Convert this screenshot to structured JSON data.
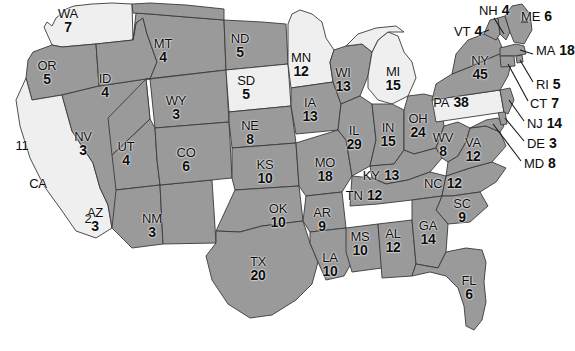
{
  "map": {
    "title": "United States Electoral College Map",
    "colors": {
      "won_fill": "#9a9a9a",
      "lost_fill": "#efefef",
      "border": "#3a3a3a",
      "background": "#ffffff",
      "label_text": "#0d0d0d"
    },
    "inline_states": [
      {
        "code": "WA",
        "ev": "7",
        "shade": "light",
        "x": 68,
        "y": 8
      },
      {
        "code": "OR",
        "ev": "5",
        "shade": "dark",
        "x": 47,
        "y": 60
      },
      {
        "code": "ID",
        "ev": "4",
        "shade": "dark",
        "x": 105,
        "y": 73
      },
      {
        "code": "MT",
        "ev": "4",
        "shade": "dark",
        "x": 163,
        "y": 38
      },
      {
        "code": "WY",
        "ev": "3",
        "shade": "dark",
        "x": 176,
        "y": 95
      },
      {
        "code": "NV",
        "ev": "3",
        "shade": "dark",
        "x": 83,
        "y": 131
      },
      {
        "code": "UT",
        "ev": "4",
        "shade": "dark",
        "x": 126,
        "y": 141
      },
      {
        "code": "AZ",
        "ev": "3",
        "shade": "dark",
        "x": 95,
        "y": 207
      },
      {
        "code": "NM",
        "ev": "3",
        "shade": "dark",
        "x": 152,
        "y": 213
      },
      {
        "code": "CO",
        "ev": "6",
        "shade": "dark",
        "x": 186,
        "y": 147
      },
      {
        "code": "ND",
        "ev": "5",
        "shade": "dark",
        "x": 240,
        "y": 33
      },
      {
        "code": "SD",
        "ev": "5",
        "shade": "light",
        "x": 246,
        "y": 75
      },
      {
        "code": "NE",
        "ev": "8",
        "shade": "dark",
        "x": 250,
        "y": 120
      },
      {
        "code": "KS",
        "ev": "10",
        "shade": "dark",
        "x": 265,
        "y": 159
      },
      {
        "code": "OK",
        "ev": "10",
        "shade": "dark",
        "x": 278,
        "y": 203
      },
      {
        "code": "TX",
        "ev": "20",
        "shade": "dark",
        "x": 258,
        "y": 256
      },
      {
        "code": "MN",
        "ev": "12",
        "shade": "light",
        "x": 301,
        "y": 52
      },
      {
        "code": "IA",
        "ev": "13",
        "shade": "dark",
        "x": 310,
        "y": 97
      },
      {
        "code": "MO",
        "ev": "18",
        "shade": "dark",
        "x": 325,
        "y": 157
      },
      {
        "code": "AR",
        "ev": "9",
        "shade": "dark",
        "x": 322,
        "y": 207
      },
      {
        "code": "LA",
        "ev": "10",
        "shade": "dark",
        "x": 330,
        "y": 252
      },
      {
        "code": "MS",
        "ev": "10",
        "shade": "dark",
        "x": 360,
        "y": 231
      },
      {
        "code": "AL",
        "ev": "12",
        "shade": "dark",
        "x": 393,
        "y": 228
      },
      {
        "code": "WI",
        "ev": "13",
        "shade": "dark",
        "x": 343,
        "y": 67
      },
      {
        "code": "MI",
        "ev": "15",
        "shade": "light",
        "x": 393,
        "y": 66
      },
      {
        "code": "IL",
        "ev": "29",
        "shade": "dark",
        "x": 354,
        "y": 125
      },
      {
        "code": "IN",
        "ev": "15",
        "shade": "dark",
        "x": 388,
        "y": 122
      },
      {
        "code": "OH",
        "ev": "24",
        "shade": "dark",
        "x": 418,
        "y": 113
      },
      {
        "code": "GA",
        "ev": "14",
        "shade": "dark",
        "x": 428,
        "y": 220
      },
      {
        "code": "SC",
        "ev": "9",
        "shade": "dark",
        "x": 462,
        "y": 198
      },
      {
        "code": "FL",
        "ev": "6",
        "shade": "dark",
        "x": 469,
        "y": 275
      },
      {
        "code": "WV",
        "ev": "8",
        "shade": "dark",
        "x": 443,
        "y": 132
      },
      {
        "code": "VA",
        "ev": "12",
        "shade": "dark",
        "x": 473,
        "y": 137
      },
      {
        "code": "NY",
        "ev": "45",
        "shade": "dark",
        "x": 480,
        "y": 55
      }
    ],
    "inline_row_states": [
      {
        "code": "KY",
        "ev": "13",
        "shade": "dark",
        "x": 381,
        "y": 167
      },
      {
        "code": "TN",
        "ev": "12",
        "shade": "dark",
        "x": 364,
        "y": 187
      },
      {
        "code": "NC",
        "ev": "12",
        "shade": "dark",
        "x": 443,
        "y": 175
      },
      {
        "code": "PA",
        "ev": "38",
        "shade": "light",
        "x": 451,
        "y": 94
      }
    ],
    "callout_states": [
      {
        "code": "NH",
        "ev": "4",
        "shade": "dark",
        "x": 479,
        "y": 2
      },
      {
        "code": "ME",
        "ev": "6",
        "shade": "dark",
        "x": 521,
        "y": 8
      },
      {
        "code": "VT",
        "ev": "4",
        "shade": "dark",
        "x": 454,
        "y": 23
      },
      {
        "code": "MA",
        "ev": "18",
        "shade": "dark",
        "x": 536,
        "y": 42
      },
      {
        "code": "RI",
        "ev": "5",
        "shade": "dark",
        "x": 536,
        "y": 76
      },
      {
        "code": "CT",
        "ev": "7",
        "shade": "dark",
        "x": 530,
        "y": 95
      },
      {
        "code": "NJ",
        "ev": "14",
        "shade": "dark",
        "x": 527,
        "y": 115
      },
      {
        "code": "DE",
        "ev": "3",
        "shade": "dark",
        "x": 527,
        "y": 135
      },
      {
        "code": "MD",
        "ev": "8",
        "shade": "dark",
        "x": 524,
        "y": 155
      }
    ],
    "ca_labels": [
      {
        "code": "11",
        "x": 22,
        "y": 140
      },
      {
        "code": "CA",
        "x": 38,
        "y": 178
      },
      {
        "code": "2",
        "x": 88,
        "y": 213
      }
    ]
  }
}
